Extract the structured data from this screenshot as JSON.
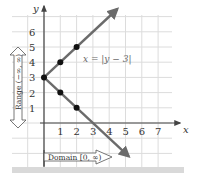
{
  "chart_data": {
    "type": "line",
    "title": "",
    "xlabel": "x",
    "ylabel": "y",
    "x_ticks": [
      "1",
      "2",
      "3",
      "4",
      "5",
      "6",
      "7"
    ],
    "y_ticks": [
      "1",
      "2",
      "3",
      "4",
      "5",
      "6"
    ],
    "xlim": [
      -2.5,
      8.5
    ],
    "ylim": [
      -2.5,
      7.5
    ],
    "grid": true,
    "series": [
      {
        "name": "x = |y − 3|",
        "points": [
          [
            0,
            3
          ],
          [
            1,
            4
          ],
          [
            2,
            5
          ],
          [
            1,
            2
          ],
          [
            2,
            1
          ]
        ],
        "upper_ray": [
          [
            0,
            3
          ],
          [
            4.5,
            7.5
          ]
        ],
        "lower_ray": [
          [
            0,
            3
          ],
          [
            5.2,
            -2.2
          ]
        ]
      }
    ],
    "annotations": {
      "curve_label": "x = |y − 3|",
      "range_label": "Range (−∞, ∞)",
      "domain_label": "Domain [0, ∞)"
    },
    "colors": {
      "curve": "#6b6b6b",
      "points": "#111111",
      "grid": "#d8d8d8",
      "axis": "#444444"
    }
  }
}
